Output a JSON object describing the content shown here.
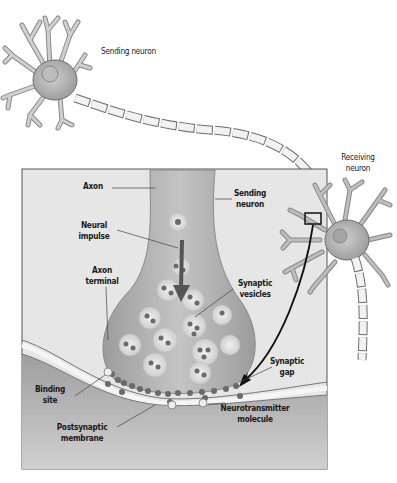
{
  "diagram": {
    "colors": {
      "background": "#ffffff",
      "panel_bg": "#e6e6e6",
      "panel_border": "#555555",
      "neuron_fill": "#a9a9a9",
      "neuron_stroke": "#6e6e6e",
      "myelin_fill": "#f2f2f2",
      "postsynaptic_fill": "#b8b8b8",
      "vesicle_fill": "#dcdcdc",
      "molecule_fill": "#6a6a6a",
      "arrow": "#111111"
    },
    "labels": {
      "sending_neuron_top": "Sending neuron",
      "receiving_neuron_line1": "Receiving",
      "receiving_neuron_line2": "neuron",
      "axon": "Axon",
      "sending_neuron_inset_line1": "Sending",
      "sending_neuron_inset_line2": "neuron",
      "neural_impulse_line1": "Neural",
      "neural_impulse_line2": "impulse",
      "axon_terminal_line1": "Axon",
      "axon_terminal_line2": "terminal",
      "synaptic_vesicles_line1": "Synaptic",
      "synaptic_vesicles_line2": "vesicles",
      "synaptic_gap_line1": "Synaptic",
      "synaptic_gap_line2": "gap",
      "binding_site_line1": "Binding",
      "binding_site_line2": "site",
      "postsynaptic_membrane_line1": "Postsynaptic",
      "postsynaptic_membrane_line2": "membrane",
      "neurotransmitter_line1": "Neurotransmitter",
      "neurotransmitter_line2": "molecule"
    }
  }
}
